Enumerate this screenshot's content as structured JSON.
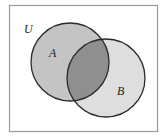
{
  "diagram": {
    "type": "venn",
    "universe_label": "U",
    "sets": [
      {
        "label": "A",
        "fill": "#c4c4c4"
      },
      {
        "label": "B",
        "fill": "#dedede"
      }
    ],
    "intersection_fill": "#8f8f8f",
    "stroke": "#2a2a2a",
    "frame_stroke": "#9a9a9a"
  }
}
